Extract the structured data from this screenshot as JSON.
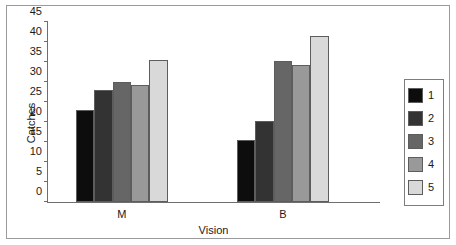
{
  "chart_data": {
    "type": "bar",
    "title": "",
    "xlabel": "Vision",
    "ylabel": "Catches",
    "categories": [
      "M",
      "B"
    ],
    "ylim": [
      0,
      45
    ],
    "yticks": [
      0,
      5,
      10,
      15,
      20,
      25,
      30,
      35,
      40,
      45
    ],
    "ytick_labels": [
      "0",
      "5",
      "10",
      "15",
      "20",
      "25",
      "30",
      "35",
      "40",
      "45"
    ],
    "grid": false,
    "legend_position": "right",
    "series": [
      {
        "name": "1",
        "values": [
          23.0,
          15.5
        ],
        "color": "#0d0d0d"
      },
      {
        "name": "2",
        "values": [
          28.0,
          20.2
        ],
        "color": "#333333"
      },
      {
        "name": "3",
        "values": [
          30.0,
          35.3
        ],
        "color": "#666666"
      },
      {
        "name": "4",
        "values": [
          29.3,
          34.3
        ],
        "color": "#999999"
      },
      {
        "name": "5",
        "values": [
          35.5,
          41.5
        ],
        "color": "#d9d9d9"
      }
    ]
  },
  "legend": {
    "items": [
      {
        "label": "1",
        "color": "#0d0d0d"
      },
      {
        "label": "2",
        "color": "#333333"
      },
      {
        "label": "3",
        "color": "#666666"
      },
      {
        "label": "4",
        "color": "#999999"
      },
      {
        "label": "5",
        "color": "#d9d9d9"
      }
    ]
  },
  "colors": {
    "axis": "#6e6e6e",
    "frame": "#9a9a9a",
    "text": "#1a1a1a",
    "background": "#ffffff"
  }
}
